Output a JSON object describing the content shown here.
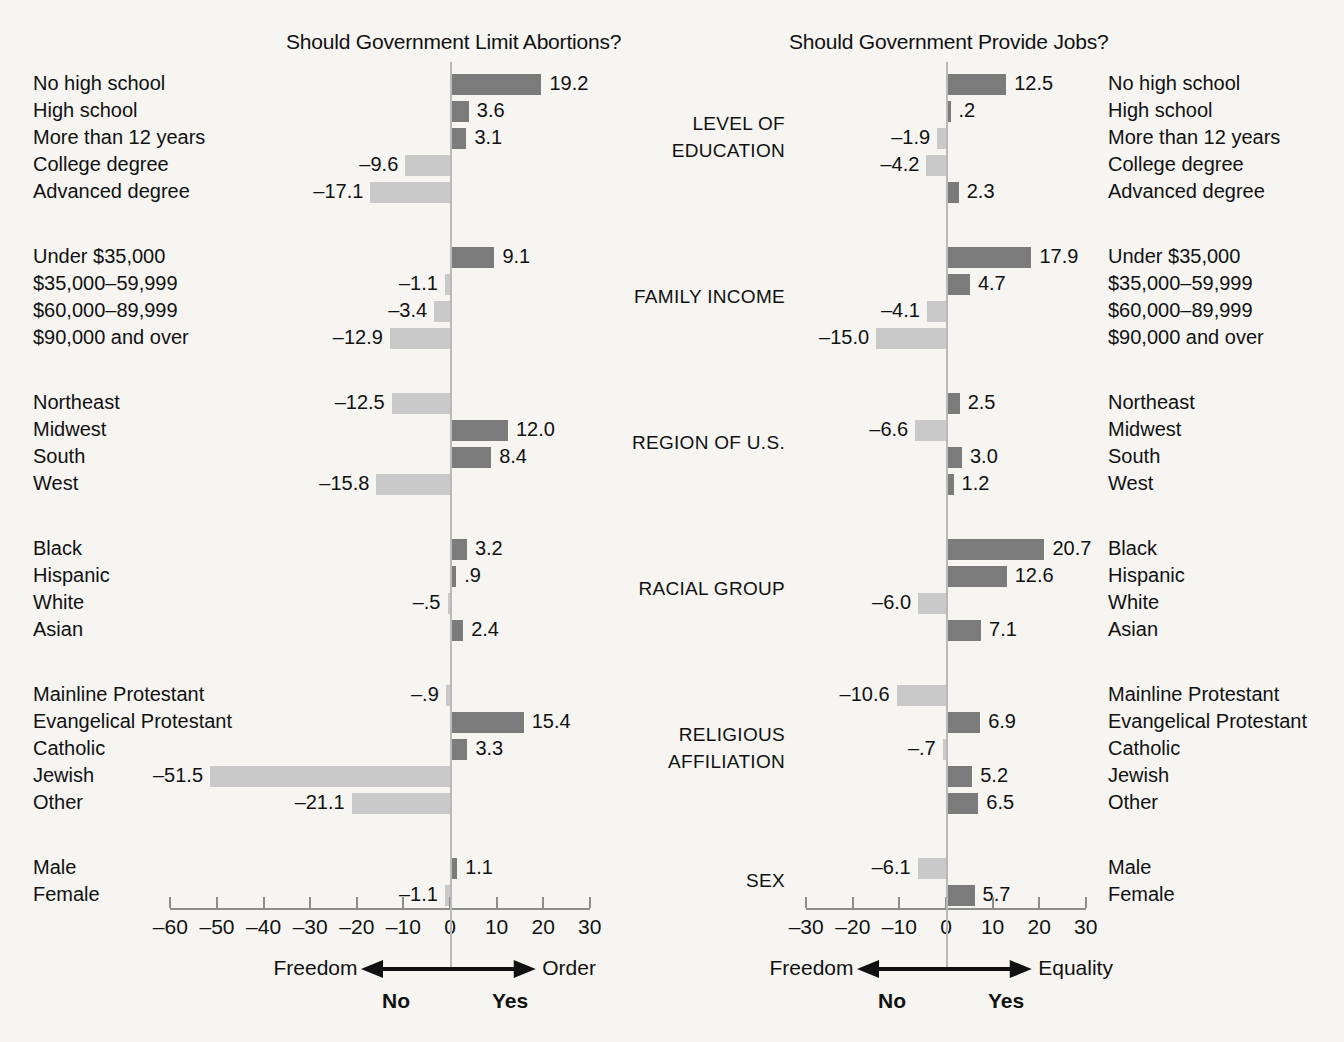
{
  "panels": {
    "left": {
      "title": "Should Government Limit Abortions?",
      "axis": {
        "ticks": [
          "–60",
          "–50",
          "–40",
          "–30",
          "–20",
          "–10",
          "0",
          "10",
          "20",
          "30"
        ],
        "min": -60,
        "max": 30,
        "left_caption": "Freedom",
        "right_caption": "Order",
        "no_label": "No",
        "yes_label": "Yes"
      }
    },
    "right": {
      "title": "Should Government Provide Jobs?",
      "axis": {
        "ticks": [
          "–30",
          "–20",
          "–10",
          "0",
          "10",
          "20",
          "30"
        ],
        "min": -30,
        "max": 30,
        "left_caption": "Freedom",
        "right_caption": "Equality",
        "no_label": "No",
        "yes_label": "Yes"
      }
    }
  },
  "groups": [
    {
      "name": "LEVEL OF EDUCATION",
      "name_lines": [
        "LEVEL OF",
        "EDUCATION"
      ],
      "rows": [
        {
          "label": "No high school",
          "left": 19.2,
          "left_text": "19.2",
          "right": 12.5,
          "right_text": "12.5"
        },
        {
          "label": "High school",
          "left": 3.6,
          "left_text": "3.6",
          "right": 0.2,
          "right_text": ".2"
        },
        {
          "label": "More than 12 years",
          "left": 3.1,
          "left_text": "3.1",
          "right": -1.9,
          "right_text": "–1.9"
        },
        {
          "label": "College degree",
          "left": -9.6,
          "left_text": "–9.6",
          "right": -4.2,
          "right_text": "–4.2"
        },
        {
          "label": "Advanced degree",
          "left": -17.1,
          "left_text": "–17.1",
          "right": 2.3,
          "right_text": "2.3"
        }
      ]
    },
    {
      "name": "FAMILY INCOME",
      "name_lines": [
        "FAMILY INCOME"
      ],
      "rows": [
        {
          "label": "Under $35,000",
          "left": 9.1,
          "left_text": "9.1",
          "right": 17.9,
          "right_text": "17.9"
        },
        {
          "label": "$35,000–59,999",
          "left": -1.1,
          "left_text": "–1.1",
          "right": 4.7,
          "right_text": "4.7"
        },
        {
          "label": "$60,000–89,999",
          "left": -3.4,
          "left_text": "–3.4",
          "right": -4.1,
          "right_text": "–4.1"
        },
        {
          "label": "$90,000 and over",
          "left": -12.9,
          "left_text": "–12.9",
          "right": -15.0,
          "right_text": "–15.0"
        }
      ]
    },
    {
      "name": "REGION OF U.S.",
      "name_lines": [
        "REGION OF U.S."
      ],
      "rows": [
        {
          "label": "Northeast",
          "left": -12.5,
          "left_text": "–12.5",
          "right": 2.5,
          "right_text": "2.5"
        },
        {
          "label": "Midwest",
          "left": 12.0,
          "left_text": "12.0",
          "right": -6.6,
          "right_text": "–6.6"
        },
        {
          "label": "South",
          "left": 8.4,
          "left_text": "8.4",
          "right": 3.0,
          "right_text": "3.0"
        },
        {
          "label": "West",
          "left": -15.8,
          "left_text": "–15.8",
          "right": 1.2,
          "right_text": "1.2"
        }
      ]
    },
    {
      "name": "RACIAL GROUP",
      "name_lines": [
        "RACIAL GROUP"
      ],
      "rows": [
        {
          "label": "Black",
          "left": 3.2,
          "left_text": "3.2",
          "right": 20.7,
          "right_text": "20.7"
        },
        {
          "label": "Hispanic",
          "left": 0.9,
          "left_text": ".9",
          "right": 12.6,
          "right_text": "12.6"
        },
        {
          "label": "White",
          "left": -0.5,
          "left_text": "–.5",
          "right": -6.0,
          "right_text": "–6.0"
        },
        {
          "label": "Asian",
          "left": 2.4,
          "left_text": "2.4",
          "right": 7.1,
          "right_text": "7.1"
        }
      ]
    },
    {
      "name": "RELIGIOUS AFFILIATION",
      "name_lines": [
        "RELIGIOUS",
        "AFFILIATION"
      ],
      "rows": [
        {
          "label": "Mainline Protestant",
          "left": -0.9,
          "left_text": "–.9",
          "right": -10.6,
          "right_text": "–10.6"
        },
        {
          "label": "Evangelical Protestant",
          "left": 15.4,
          "left_text": "15.4",
          "right": 6.9,
          "right_text": "6.9"
        },
        {
          "label": "Catholic",
          "left": 3.3,
          "left_text": "3.3",
          "right": -0.7,
          "right_text": "–.7"
        },
        {
          "label": "Jewish",
          "left": -51.5,
          "left_text": "–51.5",
          "right": 5.2,
          "right_text": "5.2"
        },
        {
          "label": "Other",
          "left": -21.1,
          "left_text": "–21.1",
          "right": 6.5,
          "right_text": "6.5"
        }
      ]
    },
    {
      "name": "SEX",
      "name_lines": [
        "SEX"
      ],
      "rows": [
        {
          "label": "Male",
          "left": 1.1,
          "left_text": "1.1",
          "right": -6.1,
          "right_text": "–6.1"
        },
        {
          "label": "Female",
          "left": -1.1,
          "left_text": "–1.1",
          "right": 5.7,
          "right_text": "5.7"
        }
      ]
    }
  ],
  "chart_data": {
    "type": "bar",
    "orientation": "horizontal",
    "grid": false,
    "legend": "none",
    "colors": {
      "positive_bar": "#7b7b7b",
      "negative_bar": "#c9c9c9",
      "background": "#f6f5f1",
      "axis": "#8d8d8d",
      "text": "#111111"
    },
    "panels": [
      {
        "name": "Should Government Limit Abortions?",
        "xlabel": "Freedom ← / → Order   (No / Yes)",
        "ylabel": "",
        "xlim": [
          -60,
          30
        ],
        "xticks": [
          -60,
          -50,
          -40,
          -30,
          -20,
          -10,
          0,
          10,
          20,
          30
        ],
        "categories": [
          "No high school",
          "High school",
          "More than 12 years",
          "College degree",
          "Advanced degree",
          "Under $35,000",
          "$35,000–59,999",
          "$60,000–89,999",
          "$90,000 and over",
          "Northeast",
          "Midwest",
          "South",
          "West",
          "Black",
          "Hispanic",
          "White",
          "Asian",
          "Mainline Protestant",
          "Evangelical Protestant",
          "Catholic",
          "Jewish",
          "Other",
          "Male",
          "Female"
        ],
        "values": [
          19.2,
          3.6,
          3.1,
          -9.6,
          -17.1,
          9.1,
          -1.1,
          -3.4,
          -12.9,
          -12.5,
          12.0,
          8.4,
          -15.8,
          3.2,
          0.9,
          -0.5,
          2.4,
          -0.9,
          15.4,
          3.3,
          -51.5,
          -21.1,
          1.1,
          -1.1
        ]
      },
      {
        "name": "Should Government Provide Jobs?",
        "xlabel": "Freedom ← / → Equality   (No / Yes)",
        "ylabel": "",
        "xlim": [
          -30,
          30
        ],
        "xticks": [
          -30,
          -20,
          -10,
          0,
          10,
          20,
          30
        ],
        "categories": [
          "No high school",
          "High school",
          "More than 12 years",
          "College degree",
          "Advanced degree",
          "Under $35,000",
          "$35,000–59,999",
          "$60,000–89,999",
          "$90,000 and over",
          "Northeast",
          "Midwest",
          "South",
          "West",
          "Black",
          "Hispanic",
          "White",
          "Asian",
          "Mainline Protestant",
          "Evangelical Protestant",
          "Catholic",
          "Jewish",
          "Other",
          "Male",
          "Female"
        ],
        "values": [
          12.5,
          0.2,
          -1.9,
          -4.2,
          2.3,
          17.9,
          4.7,
          -4.1,
          -15.0,
          2.5,
          -6.6,
          3.0,
          1.2,
          20.7,
          12.6,
          -6.0,
          7.1,
          -10.6,
          6.9,
          -0.7,
          5.2,
          6.5,
          -6.1,
          5.7
        ]
      }
    ]
  }
}
